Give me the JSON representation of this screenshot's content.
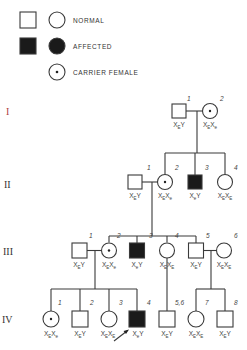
{
  "legend": {
    "items": [
      {
        "label": "NORMAL",
        "symbols": [
          "male-normal",
          "female-normal"
        ]
      },
      {
        "label": "AFFECTED",
        "symbols": [
          "male-affected",
          "female-affected"
        ]
      },
      {
        "label": "CARRIER FEMALE",
        "symbols": [
          "female-carrier"
        ]
      }
    ]
  },
  "generations": [
    {
      "label": "I",
      "color": "#b04040",
      "individuals": [
        {
          "number": "1",
          "sex": "male",
          "status": "normal",
          "genotype": [
            "X",
            "E",
            "Y",
            ""
          ]
        },
        {
          "number": "2",
          "sex": "female",
          "status": "carrier",
          "genotype": [
            "X",
            "E",
            "X",
            "e"
          ]
        }
      ]
    },
    {
      "label": "II",
      "color": "#333333",
      "individuals": [
        {
          "number": "1",
          "sex": "male",
          "status": "normal",
          "genotype": [
            "X",
            "E",
            "Y",
            ""
          ]
        },
        {
          "number": "2",
          "sex": "female",
          "status": "carrier",
          "genotype": [
            "X",
            "E",
            "X",
            "e"
          ]
        },
        {
          "number": "3",
          "sex": "male",
          "status": "affected",
          "genotype": [
            "X",
            "e",
            "Y",
            ""
          ]
        },
        {
          "number": "4",
          "sex": "female",
          "status": "normal",
          "genotype": [
            "X",
            "E",
            "X",
            "E"
          ]
        }
      ]
    },
    {
      "label": "III",
      "color": "#333333",
      "individuals": [
        {
          "number": "1",
          "sex": "male",
          "status": "normal",
          "genotype": [
            "X",
            "E",
            "Y",
            ""
          ]
        },
        {
          "number": "2",
          "sex": "female",
          "status": "carrier",
          "genotype": [
            "X",
            "E",
            "X",
            "e"
          ]
        },
        {
          "number": "3",
          "sex": "male",
          "status": "affected",
          "genotype": [
            "X",
            "e",
            "Y",
            ""
          ]
        },
        {
          "number": "4",
          "sex": "female",
          "status": "normal",
          "genotype": [
            "X",
            "E",
            "X",
            "E"
          ]
        },
        {
          "number": "5",
          "sex": "male",
          "status": "normal",
          "genotype": [
            "X",
            "E",
            "Y",
            ""
          ]
        },
        {
          "number": "6",
          "sex": "female",
          "status": "normal",
          "genotype": [
            "X",
            "E",
            "X",
            "E"
          ]
        }
      ]
    },
    {
      "label": "IV",
      "color": "#333333",
      "individuals": [
        {
          "number": "1",
          "sex": "female",
          "status": "carrier",
          "genotype": [
            "X",
            "E",
            "X",
            "e"
          ]
        },
        {
          "number": "2",
          "sex": "male",
          "status": "normal",
          "genotype": [
            "X",
            "E",
            "Y",
            ""
          ]
        },
        {
          "number": "3",
          "sex": "female",
          "status": "normal",
          "genotype": [
            "X",
            "E",
            "X",
            "E"
          ]
        },
        {
          "number": "4",
          "sex": "male",
          "status": "affected",
          "proband": true,
          "genotype": [
            "X",
            "e",
            "Y",
            ""
          ]
        },
        {
          "number": "5,6",
          "sex": "male",
          "status": "normal",
          "genotype": [
            "X",
            "E",
            "Y",
            ""
          ]
        },
        {
          "number": "7",
          "sex": "female",
          "status": "normal",
          "genotype": [
            "X",
            "E",
            "X",
            "E"
          ]
        },
        {
          "number": "8",
          "sex": "male",
          "status": "normal",
          "genotype": [
            "X",
            "E",
            "Y",
            ""
          ]
        }
      ]
    }
  ],
  "colors": {
    "line": "#3a3a3a",
    "affected_fill": "#1a1a1a",
    "background": "#ffffff"
  }
}
